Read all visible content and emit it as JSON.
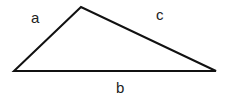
{
  "diagram": {
    "type": "triangle",
    "vertices": {
      "left": [
        14,
        71
      ],
      "top": [
        81,
        7
      ],
      "right": [
        216,
        71
      ]
    },
    "stroke_color": "#111111",
    "labels": {
      "a": "a",
      "b": "b",
      "c": "c"
    }
  }
}
